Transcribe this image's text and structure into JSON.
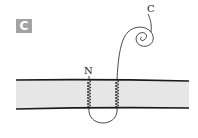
{
  "panel": {
    "label": "C"
  },
  "diagram": {
    "type": "membrane-protein-topology",
    "labels": {
      "n_terminus": "N",
      "c_terminus": "C"
    },
    "transmembrane_helices": 2,
    "colors": {
      "membrane_fill": "#e6e6e6",
      "line": "#1a1a1a",
      "badge": "#a3a3a3"
    }
  }
}
